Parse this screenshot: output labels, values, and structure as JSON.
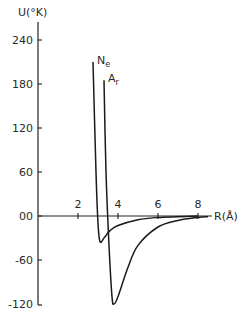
{
  "chart_data": {
    "type": "line",
    "title": "",
    "xlabel": "R(Å)",
    "ylabel": "U(°K)",
    "xlim": [
      0,
      8.5
    ],
    "ylim": [
      -120,
      240
    ],
    "x_ticks": [
      "2",
      "4",
      "6",
      "8"
    ],
    "y_ticks": [
      "240",
      "180",
      "120",
      "60",
      "00",
      "-60",
      "-120"
    ],
    "grid": false,
    "legend": "inline labels",
    "series": [
      {
        "name": "Ne",
        "label_main": "N",
        "label_sub": "e",
        "points": [
          [
            2.75,
            210
          ],
          [
            2.9,
            60
          ],
          [
            3.0,
            -10
          ],
          [
            3.1,
            -35
          ],
          [
            3.3,
            -30
          ],
          [
            3.6,
            -20
          ],
          [
            4.0,
            -13
          ],
          [
            5.0,
            -5
          ],
          [
            6.0,
            -2
          ],
          [
            7.0,
            -1
          ],
          [
            8.0,
            0
          ]
        ]
      },
      {
        "name": "Ar",
        "label_main": "A",
        "label_sub": "r",
        "points": [
          [
            3.3,
            185
          ],
          [
            3.4,
            60
          ],
          [
            3.55,
            -40
          ],
          [
            3.7,
            -110
          ],
          [
            3.8,
            -120
          ],
          [
            4.0,
            -110
          ],
          [
            4.5,
            -70
          ],
          [
            5.0,
            -40
          ],
          [
            6.0,
            -15
          ],
          [
            7.0,
            -6
          ],
          [
            8.0,
            -2
          ],
          [
            8.5,
            -1
          ]
        ]
      }
    ]
  }
}
